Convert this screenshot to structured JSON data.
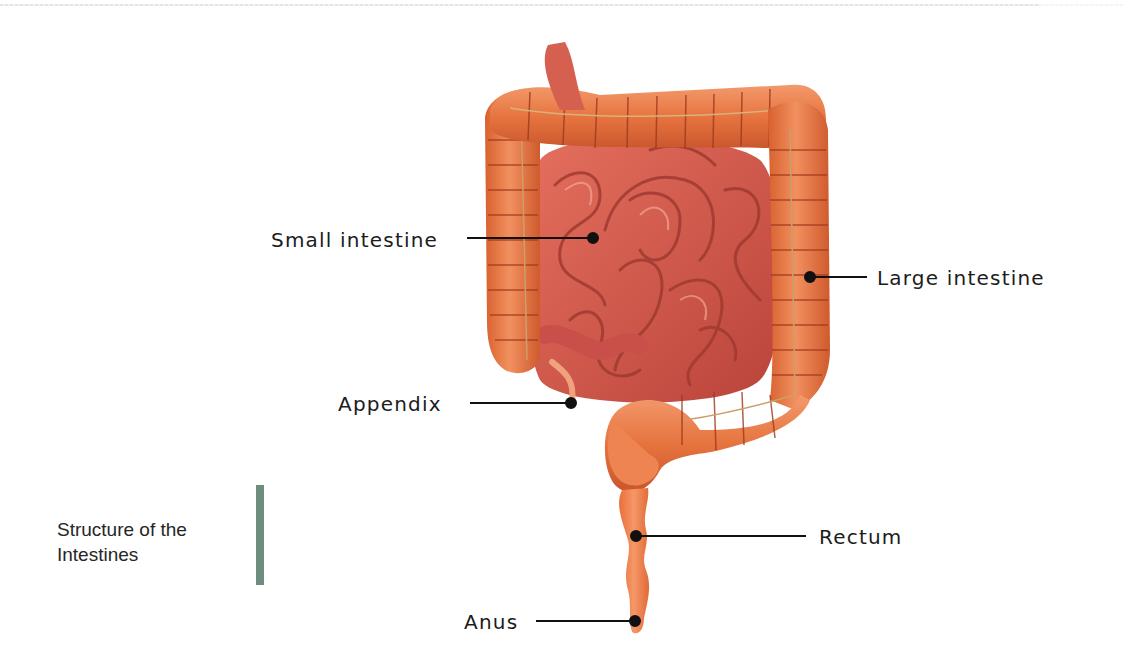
{
  "diagram": {
    "title": "Structure of the Intestines",
    "caption_line1": "Structure of the",
    "caption_line2": "Intestines",
    "labels": [
      {
        "id": "small-intestine",
        "text": "Small intestine",
        "side": "left",
        "dot": [
          593,
          238
        ]
      },
      {
        "id": "large-intestine",
        "text": "Large intestine",
        "side": "right",
        "dot": [
          810,
          277
        ]
      },
      {
        "id": "appendix",
        "text": "Appendix",
        "side": "left",
        "dot": [
          571,
          403
        ]
      },
      {
        "id": "rectum",
        "text": "Rectum",
        "side": "right",
        "dot": [
          636,
          536
        ]
      },
      {
        "id": "anus",
        "text": "Anus",
        "side": "left",
        "dot": [
          635,
          621
        ]
      }
    ]
  },
  "colors": {
    "large_intestine": "#e8774a",
    "large_intestine_dark": "#b8472a",
    "small_intestine": "#d9614f",
    "small_intestine_dark": "#a8382e",
    "appendix": "#f0a27f",
    "leader_line": "#111111",
    "caption_bar": "#6f8d7f",
    "label_text": "#1c1c1c"
  }
}
